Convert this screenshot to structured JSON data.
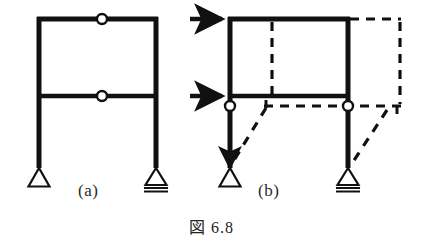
{
  "figure": {
    "caption": "図 6.8",
    "caption_number": "6.8",
    "panels": [
      {
        "id": "a",
        "label": "(a)",
        "description": "two-story portal frame with internal hinges, pin and roller supports"
      },
      {
        "id": "b",
        "label": "(b)",
        "description": "same frame with two horizontal loads and dashed deformed collapse mechanism"
      }
    ]
  },
  "style": {
    "member_color": "#111111",
    "hinge_fill": "#ffffff",
    "hinge_stroke": "#111111",
    "dashed_color": "#111111",
    "arrow_color": "#111111",
    "background": "#ffffff",
    "member_width": 5,
    "dash_pattern": "9,7"
  },
  "panel_a": {
    "members": {
      "top_beam": {
        "x1": 37,
        "y1": 19,
        "x2": 158,
        "y2": 19
      },
      "mid_beam": {
        "x1": 37,
        "y1": 96,
        "x2": 158,
        "y2": 96
      },
      "left_column": {
        "x1": 39,
        "y1": 19,
        "x2": 39,
        "y2": 166
      },
      "right_column": {
        "x1": 156,
        "y1": 19,
        "x2": 156,
        "y2": 166
      }
    },
    "hinges": [
      {
        "name": "top-beam-hinge",
        "cx": 102,
        "cy": 19,
        "r": 5
      },
      {
        "name": "mid-beam-hinge",
        "cx": 102,
        "cy": 96,
        "r": 5
      }
    ],
    "supports": [
      {
        "name": "pin-support-left",
        "type": "pin",
        "x": 39,
        "y": 166
      },
      {
        "name": "roller-support-right",
        "type": "roller",
        "x": 156,
        "y": 166
      }
    ]
  },
  "panel_b": {
    "members": {
      "top_beam": {
        "x1": 228,
        "y1": 19,
        "x2": 350,
        "y2": 19
      },
      "mid_beam": {
        "x1": 228,
        "y1": 96,
        "x2": 350,
        "y2": 96
      },
      "left_column_upper": {
        "x1": 230,
        "y1": 19,
        "x2": 230,
        "y2": 103
      },
      "right_column_upper": {
        "x1": 348,
        "y1": 19,
        "x2": 348,
        "y2": 103
      },
      "left_column_lower": {
        "x1": 230,
        "y1": 110,
        "x2": 230,
        "y2": 166
      },
      "right_column_lower": {
        "x1": 348,
        "y1": 110,
        "x2": 348,
        "y2": 166
      }
    },
    "hinges": [
      {
        "name": "left-joint-hinge",
        "cx": 230,
        "cy": 106,
        "r": 5
      },
      {
        "name": "right-joint-hinge",
        "cx": 348,
        "cy": 106,
        "r": 5
      }
    ],
    "supports": [
      {
        "name": "pin-support-left",
        "type": "pin",
        "x": 230,
        "y": 166
      },
      {
        "name": "roller-support-right",
        "type": "roller",
        "x": 348,
        "y": 166
      }
    ],
    "load_arrows": [
      {
        "name": "load-arrow-top",
        "x1": 190,
        "y1": 19,
        "x2": 228,
        "y2": 19
      },
      {
        "name": "load-arrow-mid",
        "x1": 190,
        "y1": 96,
        "x2": 228,
        "y2": 96
      }
    ],
    "deformed_shape": {
      "interior_vertical_dashed": {
        "x1": 272,
        "y1": 22,
        "x2": 272,
        "y2": 96
      },
      "top_beam_extension_dashed": {
        "x1": 350,
        "y1": 19,
        "x2": 400,
        "y2": 19
      },
      "right_displaced_column_dashed": {
        "x1": 400,
        "y1": 19,
        "x2": 400,
        "y2": 106
      },
      "mid_beam_displaced_dashed": {
        "x1": 266,
        "y1": 106,
        "x2": 400,
        "y2": 106
      },
      "left_column_displaced_dashed": {
        "x1": 266,
        "y1": 106,
        "x2": 232,
        "y2": 163
      },
      "right_column_displaced_dashed": {
        "x1": 386,
        "y1": 112,
        "x2": 352,
        "y2": 163
      }
    }
  }
}
